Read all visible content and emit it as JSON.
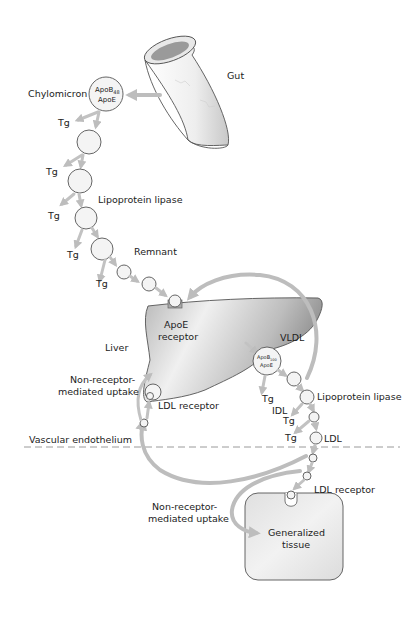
{
  "diagram": {
    "labels": {
      "gut": "Gut",
      "chylomicron": "Chylomicron",
      "chylomicron_apo_line1": "ApoB",
      "chylomicron_apo_sub": "48",
      "chylomicron_apo_line2": "ApoE",
      "tg": "Tg",
      "lipoprotein_lipase_1": "Lipoprotein lipase",
      "remnant": "Remnant",
      "liver": "Liver",
      "apoe_receptor_line1": "ApoE",
      "apoe_receptor_line2": "receptor",
      "vldl": "VLDL",
      "vldl_apo_line1": "ApoB",
      "vldl_apo_sub": "100",
      "vldl_apo_line2": "ApoE",
      "non_receptor_1_line1": "Non-receptor-",
      "non_receptor_1_line2": "mediated uptake",
      "ldl_receptor_liver": "LDL receptor",
      "idl": "IDL",
      "lipoprotein_lipase_2": "Lipoprotein lipase",
      "ldl": "LDL",
      "vascular_endothelium": "Vascular endothelium",
      "ldl_receptor_tissue": "LDL receptor",
      "non_receptor_2_line1": "Non-receptor-",
      "non_receptor_2_line2": "mediated uptake",
      "tissue_line1": "Generalized",
      "tissue_line2": "tissue"
    },
    "colors": {
      "arrow": "#bdbdbd",
      "outline": "#555555",
      "liver_dark": "#8c8c8c",
      "liver_light": "#f2f2f2",
      "tissue_fill": "#e4e4e4",
      "dashed_line": "#9a9a9a"
    }
  }
}
